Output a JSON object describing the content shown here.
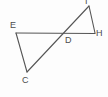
{
  "figure": {
    "kind": "geometry-diagram",
    "background_color": "#fdfdfd",
    "stroke_color": "#555555",
    "label_color": "#4c4c4c",
    "stroke_width": 1.1,
    "width": 108,
    "height": 97
  },
  "points": {
    "E": {
      "label": "E",
      "x": 16,
      "y": 33
    },
    "C": {
      "label": "C",
      "x": 27,
      "y": 72
    },
    "D": {
      "label": "D",
      "x": 66,
      "y": 34
    },
    "H": {
      "label": "H",
      "x": 95,
      "y": 33
    },
    "I": {
      "label": "I",
      "x": 89,
      "y": 6
    }
  },
  "segments": [
    {
      "name": "segment-E-H",
      "from": "E",
      "to": "H"
    },
    {
      "name": "segment-E-C",
      "from": "E",
      "to": "C"
    },
    {
      "name": "segment-C-I",
      "from": "C",
      "to": "I"
    },
    {
      "name": "segment-I-H",
      "from": "I",
      "to": "H"
    }
  ]
}
